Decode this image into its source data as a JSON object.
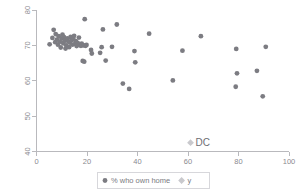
{
  "chart_data": {
    "type": "scatter",
    "title": "",
    "xlabel": "",
    "ylabel": "",
    "xlim": [
      0,
      100
    ],
    "ylim": [
      40,
      80
    ],
    "xticks": [
      0,
      20,
      40,
      60,
      80,
      100
    ],
    "yticks": [
      40,
      50,
      60,
      70,
      80
    ],
    "xtick_labels": [
      "0",
      "20",
      "40",
      "60",
      "80",
      "100"
    ],
    "ytick_labels": [
      "40",
      "50",
      "60",
      "70",
      "80"
    ],
    "grid": false,
    "legend_position": "bottom-center",
    "series": [
      {
        "name": "% who own home",
        "marker": "circle",
        "color": "#7c7c82",
        "points": [
          [
            5.2,
            70.3
          ],
          [
            6.3,
            72.1
          ],
          [
            6.8,
            74.4
          ],
          [
            7.4,
            70.9
          ],
          [
            7.6,
            73.2
          ],
          [
            8.1,
            71.6
          ],
          [
            8.5,
            70.2
          ],
          [
            8.8,
            72.6
          ],
          [
            9.2,
            71.0
          ],
          [
            9.6,
            69.4
          ],
          [
            9.9,
            71.9
          ],
          [
            10.3,
            73.0
          ],
          [
            10.6,
            70.6
          ],
          [
            10.9,
            72.3
          ],
          [
            11.2,
            71.3
          ],
          [
            11.5,
            69.1
          ],
          [
            11.8,
            70.0
          ],
          [
            12.2,
            72.0
          ],
          [
            12.6,
            71.1
          ],
          [
            12.9,
            69.5
          ],
          [
            13.2,
            70.8
          ],
          [
            13.5,
            72.4
          ],
          [
            13.9,
            71.5
          ],
          [
            14.2,
            70.2
          ],
          [
            14.6,
            71.8
          ],
          [
            14.9,
            72.7
          ],
          [
            15.3,
            70.4
          ],
          [
            15.6,
            71.2
          ],
          [
            15.9,
            69.8
          ],
          [
            16.3,
            70.7
          ],
          [
            16.8,
            72.2
          ],
          [
            17.2,
            70.1
          ],
          [
            17.6,
            69.9
          ],
          [
            17.9,
            70.5
          ],
          [
            18.3,
            65.6
          ],
          [
            18.6,
            70.0
          ],
          [
            18.9,
            65.4
          ],
          [
            19.1,
            77.4
          ],
          [
            19.4,
            69.9
          ],
          [
            19.8,
            70.1
          ],
          [
            21.6,
            68.7
          ],
          [
            21.9,
            67.7
          ],
          [
            25.2,
            67.9
          ],
          [
            25.8,
            69.5
          ],
          [
            26.3,
            74.5
          ],
          [
            27.4,
            65.7
          ],
          [
            29.9,
            69.6
          ],
          [
            31.8,
            75.9
          ],
          [
            34.2,
            59.2
          ],
          [
            36.7,
            57.7
          ],
          [
            38.8,
            68.4
          ],
          [
            39.1,
            65.2
          ],
          [
            44.6,
            73.3
          ],
          [
            54.0,
            60.1
          ],
          [
            57.8,
            68.5
          ],
          [
            65.1,
            72.6
          ],
          [
            78.9,
            58.3
          ],
          [
            79.1,
            69.0
          ],
          [
            79.4,
            62.1
          ],
          [
            87.3,
            62.8
          ],
          [
            89.6,
            55.6
          ],
          [
            90.8,
            69.6
          ]
        ]
      },
      {
        "name": "y",
        "marker": "diamond",
        "color": "#c9c9cd",
        "points": [
          [
            61.0,
            42.5
          ]
        ],
        "point_labels": [
          "DC"
        ]
      }
    ]
  },
  "legend": {
    "entries": [
      {
        "label": "% who own home",
        "marker": "circle",
        "color": "#7c7c82"
      },
      {
        "label": "y",
        "marker": "diamond",
        "color": "#c9c9cd"
      }
    ]
  },
  "annotations": [
    {
      "text": "DC",
      "x": 61.0,
      "y": 42.5
    }
  ],
  "colors": {
    "own_home_marker": "#7c7c82",
    "y_marker": "#c9c9cd",
    "axis": "#b9b9bd",
    "tick_text": "#8a8a8f",
    "legend_border": "#d7d7db",
    "background": "#ffffff"
  }
}
